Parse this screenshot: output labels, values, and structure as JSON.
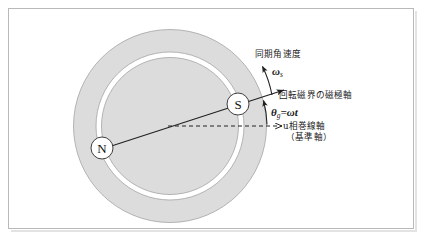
{
  "figure": {
    "title_alt": "同期機 回転磁界の磁極軸と基準軸",
    "background_color": "#ffffff",
    "frame_border_color": "#b9b9b9"
  },
  "machine": {
    "stator_ring": {
      "name": "stator-ring",
      "fill_color": "#dcdcdc",
      "stroke_color": "#9a9a9a",
      "center_x": 170,
      "center_y": 126,
      "radius": 97
    },
    "air_gap": {
      "name": "air-gap-ring",
      "fill_color": "#ffffff",
      "radius": 74
    },
    "rotor": {
      "name": "rotor-disc",
      "fill_color": "#dcdcdc",
      "stroke_color": "#9a9a9a",
      "radius": 69
    },
    "poles": [
      {
        "label": "N",
        "name": "pole-n",
        "cx": 102,
        "cy": 148,
        "r": 11
      },
      {
        "label": "S",
        "name": "pole-s",
        "cx": 238,
        "cy": 104,
        "r": 11
      }
    ]
  },
  "annotations": {
    "sync_angular_velocity": "同期角速度",
    "omega_s_symbol": "ω",
    "omega_s_subscript": "s",
    "rotating_field_pole_axis": "回転磁界の磁極軸",
    "theta_symbol": "θ",
    "theta_subscript": "g",
    "theta_equation_rest": "=ωt",
    "u_phase_winding_axis": "u相巻線軸",
    "reference_axis": "（基準軸）"
  },
  "colors": {
    "line": "#222222",
    "ring_fill": "#dcdcdc",
    "ring_stroke": "#9a9a9a",
    "text": "#1a1a1a"
  }
}
